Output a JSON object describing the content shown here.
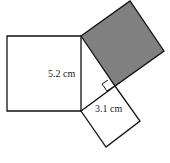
{
  "diagram": {
    "labels": {
      "left_side": "5.2 cm",
      "bottom_side": "3.1 cm"
    },
    "colors": {
      "stroke": "#111111",
      "shaded": "#808080",
      "background": "#ffffff"
    },
    "shapes": [
      {
        "name": "left-square",
        "side": "5.2 cm",
        "shaded": false
      },
      {
        "name": "hypotenuse-square",
        "shaded": true
      },
      {
        "name": "small-square",
        "side": "3.1 cm",
        "shaded": false
      }
    ]
  }
}
